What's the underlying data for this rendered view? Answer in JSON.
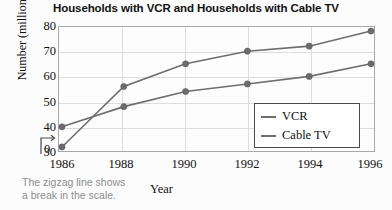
{
  "chart_data": {
    "type": "line",
    "title": "Households with VCR and Households with Cable TV",
    "xlabel": "Year",
    "ylabel": "Number (millions)",
    "categories": [
      "1986",
      "1988",
      "1990",
      "1992",
      "1994",
      "1996"
    ],
    "x": [
      1986,
      1988,
      1990,
      1992,
      1994,
      1996
    ],
    "series": [
      {
        "name": "VCR",
        "values": [
          32,
          56,
          65,
          70,
          72,
          78
        ]
      },
      {
        "name": "Cable TV",
        "values": [
          40,
          48,
          54,
          57,
          60,
          65
        ]
      }
    ],
    "ylim": [
      30,
      80
    ],
    "y_ticks": [
      "80",
      "70",
      "60",
      "50",
      "40",
      "30"
    ],
    "y_origin_label": "0",
    "xlim": [
      1986,
      1996
    ],
    "grid": true,
    "legend_position": "bottom-right",
    "annotation": "The zigzag line shows\na break in the scale.",
    "axis_break": "zigzag-break-on-y-axis",
    "colors": {
      "line": "#6e6e6e",
      "marker": "#6b6b6b",
      "grid": "#dddddd",
      "frame": "#a8a8a8",
      "caption": "#8d8d8d",
      "text": "#111111"
    }
  },
  "legend": {
    "entries": [
      {
        "label": "VCR"
      },
      {
        "label": "Cable TV"
      }
    ]
  }
}
